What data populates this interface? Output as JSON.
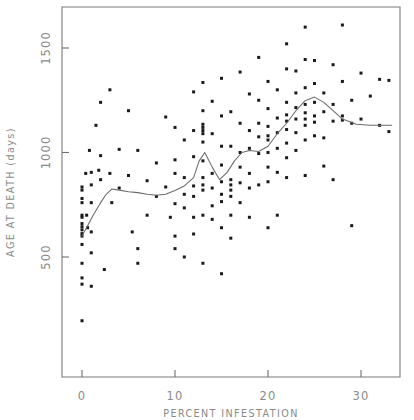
{
  "chart_data": {
    "type": "scatter",
    "title": "",
    "xlabel": "PERCENT  INFESTATION",
    "ylabel": "AGE AT DEATH (days)",
    "xlim": [
      -2.2,
      34.2
    ],
    "ylim": [
      60,
      1720
    ],
    "xticks": [
      0,
      10,
      20,
      30
    ],
    "xticklabels": [
      "0",
      "10",
      "20",
      "30"
    ],
    "yticks": [
      500,
      1000,
      1500
    ],
    "yticklabels": [
      "500",
      "1000",
      "1500"
    ],
    "grid": false,
    "legend": null,
    "marker": "filled-square",
    "points": [
      [
        0,
        835
      ],
      [
        0,
        820
      ],
      [
        0,
        780
      ],
      [
        0,
        760
      ],
      [
        0,
        700
      ],
      [
        0,
        690
      ],
      [
        0,
        660
      ],
      [
        0,
        645
      ],
      [
        0,
        630
      ],
      [
        0,
        612
      ],
      [
        0,
        600
      ],
      [
        0,
        560
      ],
      [
        0,
        470
      ],
      [
        0,
        400
      ],
      [
        0,
        370
      ],
      [
        0,
        195
      ],
      [
        0.4,
        900
      ],
      [
        0.5,
        700
      ],
      [
        0.6,
        640
      ],
      [
        0.8,
        1010
      ],
      [
        1,
        905
      ],
      [
        1,
        845
      ],
      [
        1,
        760
      ],
      [
        1,
        620
      ],
      [
        1,
        520
      ],
      [
        1,
        360
      ],
      [
        1.5,
        1130
      ],
      [
        1.8,
        915
      ],
      [
        2,
        1240
      ],
      [
        2,
        985
      ],
      [
        2,
        870
      ],
      [
        2.4,
        440
      ],
      [
        3,
        1300
      ],
      [
        3,
        900
      ],
      [
        3.2,
        760
      ],
      [
        4,
        1015
      ],
      [
        4,
        830
      ],
      [
        5,
        1200
      ],
      [
        5,
        890
      ],
      [
        5.4,
        620
      ],
      [
        6,
        1010
      ],
      [
        6,
        540
      ],
      [
        6,
        470
      ],
      [
        7,
        865
      ],
      [
        7,
        700
      ],
      [
        8,
        950
      ],
      [
        8,
        790
      ],
      [
        9,
        1170
      ],
      [
        9,
        835
      ],
      [
        9.5,
        690
      ],
      [
        10,
        1120
      ],
      [
        10,
        965
      ],
      [
        10,
        900
      ],
      [
        10,
        755
      ],
      [
        10,
        600
      ],
      [
        10,
        540
      ],
      [
        11,
        1060
      ],
      [
        11,
        880
      ],
      [
        11,
        800
      ],
      [
        11,
        735
      ],
      [
        11,
        500
      ],
      [
        12,
        1290
      ],
      [
        12,
        1105
      ],
      [
        12,
        980
      ],
      [
        12,
        840
      ],
      [
        12,
        790
      ],
      [
        12,
        690
      ],
      [
        12,
        610
      ],
      [
        13,
        1335
      ],
      [
        13,
        1200
      ],
      [
        13,
        1135
      ],
      [
        13,
        1120
      ],
      [
        13,
        1105
      ],
      [
        13,
        1090
      ],
      [
        13,
        1050
      ],
      [
        13,
        960
      ],
      [
        13,
        880
      ],
      [
        13,
        845
      ],
      [
        13,
        820
      ],
      [
        13,
        700
      ],
      [
        13,
        470
      ],
      [
        14,
        1245
      ],
      [
        14,
        1090
      ],
      [
        14,
        900
      ],
      [
        14,
        830
      ],
      [
        14,
        745
      ],
      [
        14,
        680
      ],
      [
        15,
        1355
      ],
      [
        15,
        1175
      ],
      [
        15,
        1030
      ],
      [
        15,
        940
      ],
      [
        15,
        860
      ],
      [
        15,
        800
      ],
      [
        15,
        765
      ],
      [
        15,
        640
      ],
      [
        15,
        420
      ],
      [
        16,
        1195
      ],
      [
        16,
        1030
      ],
      [
        16,
        870
      ],
      [
        16,
        845
      ],
      [
        16,
        820
      ],
      [
        16,
        790
      ],
      [
        16,
        700
      ],
      [
        16,
        590
      ],
      [
        17,
        1385
      ],
      [
        17,
        1140
      ],
      [
        17,
        1000
      ],
      [
        17,
        930
      ],
      [
        17,
        855
      ],
      [
        17,
        760
      ],
      [
        18,
        1280
      ],
      [
        18,
        1105
      ],
      [
        18,
        1020
      ],
      [
        18,
        900
      ],
      [
        18,
        830
      ],
      [
        18,
        690
      ],
      [
        19,
        1455
      ],
      [
        19,
        1250
      ],
      [
        19,
        1140
      ],
      [
        19,
        1075
      ],
      [
        19,
        995
      ],
      [
        19,
        845
      ],
      [
        20,
        1340
      ],
      [
        20,
        1210
      ],
      [
        20,
        1125
      ],
      [
        20,
        1080
      ],
      [
        20,
        1060
      ],
      [
        20,
        1000
      ],
      [
        20,
        930
      ],
      [
        20,
        860
      ],
      [
        20,
        640
      ],
      [
        21,
        1300
      ],
      [
        21,
        1165
      ],
      [
        21,
        1095
      ],
      [
        21,
        1020
      ],
      [
        21,
        905
      ],
      [
        21,
        700
      ],
      [
        22,
        1520
      ],
      [
        22,
        1400
      ],
      [
        22,
        1240
      ],
      [
        22,
        1180
      ],
      [
        22,
        1150
      ],
      [
        22,
        1110
      ],
      [
        22,
        1045
      ],
      [
        22,
        975
      ],
      [
        22,
        880
      ],
      [
        23,
        1390
      ],
      [
        23,
        1285
      ],
      [
        23,
        1215
      ],
      [
        23,
        1160
      ],
      [
        23,
        1095
      ],
      [
        23,
        1010
      ],
      [
        24,
        1600
      ],
      [
        24,
        1445
      ],
      [
        24,
        1310
      ],
      [
        24,
        1230
      ],
      [
        24,
        1190
      ],
      [
        24,
        1160
      ],
      [
        24,
        1130
      ],
      [
        24,
        1060
      ],
      [
        24,
        890
      ],
      [
        25,
        1440
      ],
      [
        25,
        1330
      ],
      [
        25,
        1240
      ],
      [
        25,
        1175
      ],
      [
        25,
        1145
      ],
      [
        25,
        1080
      ],
      [
        26,
        1285
      ],
      [
        26,
        1195
      ],
      [
        26,
        1070
      ],
      [
        26,
        935
      ],
      [
        27,
        1420
      ],
      [
        27,
        1230
      ],
      [
        27,
        1150
      ],
      [
        27,
        870
      ],
      [
        28,
        1610
      ],
      [
        28,
        1340
      ],
      [
        28,
        1175
      ],
      [
        28,
        1155
      ],
      [
        29,
        1250
      ],
      [
        29,
        1140
      ],
      [
        29,
        650
      ],
      [
        30,
        1380
      ],
      [
        30,
        1160
      ],
      [
        31,
        1270
      ],
      [
        32,
        1350
      ],
      [
        32,
        1130
      ],
      [
        33,
        1345
      ],
      [
        33,
        1100
      ]
    ],
    "smooth_curve": {
      "label": "lowess-smooth",
      "x": [
        0,
        0.6,
        1.2,
        2.0,
        2.6,
        3.2,
        4.0,
        5.0,
        6.0,
        7.0,
        8.0,
        9.0,
        10.0,
        11.0,
        12.0,
        12.6,
        13.2,
        14.0,
        14.8,
        15.6,
        16.4,
        17.2,
        18.0,
        19.0,
        20.0,
        21.0,
        22.0,
        23.0,
        24.0,
        25.0,
        26.0,
        27.0,
        28.0,
        29.5,
        31.0,
        33.3
      ],
      "y": [
        600,
        650,
        700,
        760,
        800,
        825,
        820,
        812,
        808,
        800,
        795,
        800,
        818,
        840,
        880,
        960,
        1000,
        930,
        870,
        905,
        960,
        1000,
        1010,
        1005,
        1030,
        1090,
        1140,
        1200,
        1248,
        1265,
        1240,
        1200,
        1160,
        1135,
        1130,
        1130
      ]
    }
  }
}
